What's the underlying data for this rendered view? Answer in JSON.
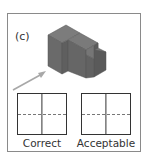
{
  "figure": {
    "label": "(c)",
    "object": "isometric-stepped-block",
    "arrow": "viewing-direction-arrow",
    "views": [
      {
        "caption": "Correct",
        "divider": "vertical-solid",
        "hidden_line": "horizontal-dashed"
      },
      {
        "caption": "Acceptable",
        "divider": "vertical-solid",
        "hidden_line": "horizontal-dashed"
      }
    ]
  },
  "colors": {
    "frame": "#8a8a8a",
    "solid_top": "#7a7a7a",
    "solid_front": "#6b6b6b",
    "solid_side": "#5e5e5e",
    "arrow": "#a8a8a8",
    "lines": "#333333",
    "hidden": "#777777"
  }
}
